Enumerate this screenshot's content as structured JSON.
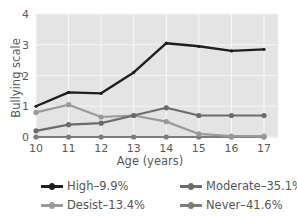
{
  "chart_data": {
    "type": "line",
    "title": "",
    "xlabel": "Age (years)",
    "ylabel": "Bullying scale",
    "x": [
      10,
      11,
      12,
      13,
      14,
      15,
      16,
      17
    ],
    "xticks": [
      "10",
      "11",
      "12",
      "13",
      "14",
      "15",
      "16",
      "17"
    ],
    "yticks": [
      "0",
      "1",
      "2",
      "3",
      "4"
    ],
    "ylim": [
      0,
      4
    ],
    "grid": true,
    "legend_position": "bottom",
    "series": [
      {
        "name": "High–9.9%",
        "color": "#1e1e1e",
        "values": [
          1.0,
          1.45,
          1.42,
          2.1,
          3.05,
          2.95,
          2.8,
          2.85
        ]
      },
      {
        "name": "Moderate–35.1%",
        "color": "#6b6b6b",
        "values": [
          0.2,
          0.4,
          0.45,
          0.7,
          0.95,
          0.7,
          0.7,
          0.7
        ]
      },
      {
        "name": "Desist–13.4%",
        "color": "#9a9a9a",
        "values": [
          0.8,
          1.05,
          0.65,
          0.7,
          0.5,
          0.1,
          0.03,
          0.03
        ]
      },
      {
        "name": "Never–41.6%",
        "color": "#7c7c7c",
        "values": [
          0.0,
          0.0,
          0.0,
          0.0,
          0.0,
          0.0,
          0.0,
          0.0
        ]
      }
    ]
  },
  "legend": [
    {
      "label": "High–9.9%",
      "color": "#1e1e1e"
    },
    {
      "label": "Moderate–35.1%",
      "color": "#6b6b6b"
    },
    {
      "label": "Desist–13.4%",
      "color": "#9a9a9a"
    },
    {
      "label": "Never–41.6%",
      "color": "#7c7c7c"
    }
  ]
}
